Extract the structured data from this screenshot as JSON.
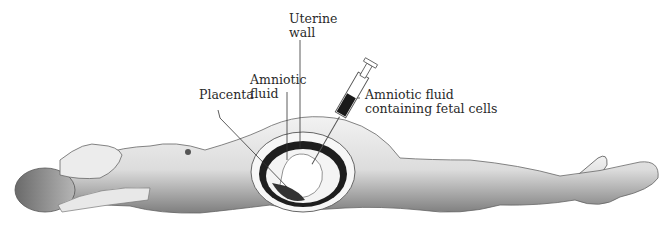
{
  "figure": {
    "labels": {
      "uterine_wall": "Uterine\nwall",
      "amniotic_fluid": "Amniotic\nfluid",
      "placenta": "Placenta",
      "syringe_contents": "Amniotic fluid\ncontaining fetal cells"
    },
    "colors": {
      "background": "#ffffff",
      "line": "#333333",
      "body_fill": "#e2e2e2",
      "shadow": "#8a8a8a",
      "uterus_dark": "#1e1e1e",
      "fluid": "#f4f4f4"
    }
  }
}
